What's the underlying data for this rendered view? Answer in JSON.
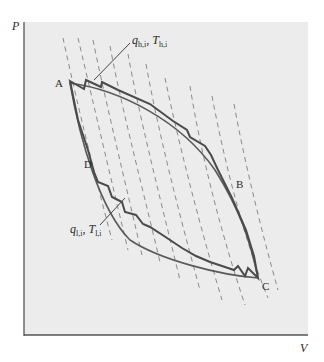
{
  "figure": {
    "type": "P-V cycle diagram",
    "axes": {
      "y_label": "P",
      "x_label": "V"
    },
    "points": [
      {
        "name": "A",
        "label": "A"
      },
      {
        "name": "B",
        "label": "B"
      },
      {
        "name": "C",
        "label": "C"
      },
      {
        "name": "D",
        "label": "D"
      }
    ],
    "annotations": {
      "hot": {
        "q": "q",
        "q_sub": "h,i",
        "sep": ", ",
        "T": "T",
        "T_sub": "h,i"
      },
      "cold": {
        "q": "q",
        "q_sub": "l,i",
        "sep": ", ",
        "T": "T",
        "T_sub": "l,i"
      }
    },
    "colors": {
      "background": "#ffffff",
      "plot_area": "#ececec",
      "curve": "#4a4a4a",
      "dashes": "#8a8a8a",
      "axis": "#555555"
    }
  }
}
